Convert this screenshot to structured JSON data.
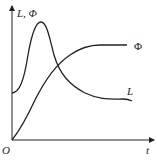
{
  "figure": {
    "y_axis_label": "L, Φ",
    "x_axis_label": "t",
    "origin_label": "O",
    "curves": [
      {
        "name": "L",
        "label": "L",
        "shape": "starts mid-height, sharp peak early, decays and levels off"
      },
      {
        "name": "Phi",
        "label": "Φ",
        "shape": "starts at origin, rises sigmoidally, saturates"
      }
    ],
    "line_color": "#222222"
  }
}
